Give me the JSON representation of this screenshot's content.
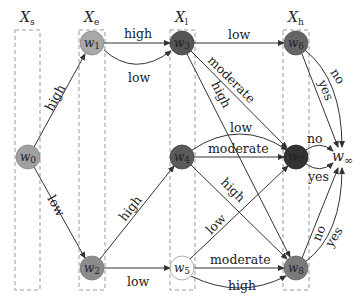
{
  "columns": [
    {
      "id": "Xs",
      "label": "X",
      "sub": "s",
      "x": 15,
      "w": 25
    },
    {
      "id": "Xe",
      "label": "X",
      "sub": "e",
      "x": 79,
      "w": 26
    },
    {
      "id": "Xl",
      "label": "X",
      "sub": "l",
      "x": 170,
      "w": 25
    },
    {
      "id": "Xh",
      "label": "X",
      "sub": "h",
      "x": 283,
      "w": 26
    }
  ],
  "nodes": [
    {
      "id": "w0",
      "label": "w",
      "sub": "0",
      "x": 28,
      "y": 157,
      "fill": "#a0a0a0"
    },
    {
      "id": "w1",
      "label": "w",
      "sub": "1",
      "x": 92,
      "y": 43,
      "fill": "#a8a8a8"
    },
    {
      "id": "w2",
      "label": "w",
      "sub": "2",
      "x": 92,
      "y": 268,
      "fill": "#8c8c8c"
    },
    {
      "id": "w3",
      "label": "w",
      "sub": "3",
      "x": 182,
      "y": 43,
      "fill": "#555555"
    },
    {
      "id": "w4",
      "label": "w",
      "sub": "4",
      "x": 182,
      "y": 157,
      "fill": "#5a5a5a"
    },
    {
      "id": "w5",
      "label": "w",
      "sub": "5",
      "x": 182,
      "y": 268,
      "fill": "#ffffff"
    },
    {
      "id": "w6",
      "label": "w",
      "sub": "6",
      "x": 296,
      "y": 43,
      "fill": "#666666"
    },
    {
      "id": "w7",
      "label": "w",
      "sub": "7",
      "x": 296,
      "y": 157,
      "fill": "#333333"
    },
    {
      "id": "w8",
      "label": "w",
      "sub": "8",
      "x": 296,
      "y": 268,
      "fill": "#7a7a7a"
    },
    {
      "id": "winf",
      "label": "w",
      "sub": "∞",
      "x": 345,
      "y": 157,
      "fill": "none"
    }
  ],
  "edges": [
    {
      "from": "w0",
      "to": "w1",
      "label": "high"
    },
    {
      "from": "w0",
      "to": "w2",
      "label": "low"
    },
    {
      "from": "w1",
      "to": "w3",
      "label": "high"
    },
    {
      "from": "w1",
      "to": "w3",
      "label": "low"
    },
    {
      "from": "w2",
      "to": "w4",
      "label": "high"
    },
    {
      "from": "w2",
      "to": "w5",
      "label": "low"
    },
    {
      "from": "w3",
      "to": "w6",
      "label": "low"
    },
    {
      "from": "w3",
      "to": "w7",
      "label": "moderate"
    },
    {
      "from": "w3",
      "to": "w8",
      "label": "high"
    },
    {
      "from": "w4",
      "to": "w7",
      "label": "low"
    },
    {
      "from": "w4",
      "to": "w7",
      "label": "moderate"
    },
    {
      "from": "w4",
      "to": "w8",
      "label": "high"
    },
    {
      "from": "w5",
      "to": "w7",
      "label": "low"
    },
    {
      "from": "w5",
      "to": "w8",
      "label": "moderate"
    },
    {
      "from": "w5",
      "to": "w8",
      "label": "high"
    },
    {
      "from": "w6",
      "to": "winf",
      "label": "no"
    },
    {
      "from": "w6",
      "to": "winf",
      "label": "yes"
    },
    {
      "from": "w7",
      "to": "winf",
      "label": "no"
    },
    {
      "from": "w7",
      "to": "winf",
      "label": "yes"
    },
    {
      "from": "w8",
      "to": "winf",
      "label": "no"
    },
    {
      "from": "w8",
      "to": "winf",
      "label": "yes"
    }
  ],
  "labels": {
    "e0": "high",
    "e1": "low",
    "e2": "high",
    "e3": "low",
    "e4": "high",
    "e5": "low",
    "e6": "low",
    "e7": "moderate",
    "e8": "high",
    "e9": "low",
    "e10": "moderate",
    "e11": "high",
    "e12": "low",
    "e13": "moderate",
    "e14": "high",
    "e15": "no",
    "e16": "yes",
    "e17": "no",
    "e18": "yes",
    "e19": "no",
    "e20": "yes"
  }
}
